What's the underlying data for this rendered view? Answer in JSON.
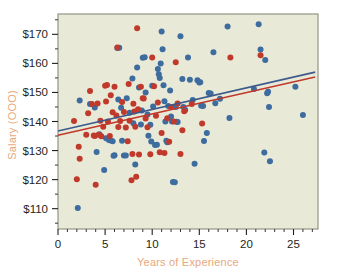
{
  "chart_data": {
    "type": "scatter",
    "title": "",
    "xlabel": "Years of Experience",
    "ylabel": "Salary (OOO)",
    "xlim": [
      0,
      27.6
    ],
    "ylim": [
      103,
      177
    ],
    "grid": false,
    "legend_position": "none",
    "plot_background": "#e9e9d7",
    "plot_border": "#8c8c7a",
    "axis_label_color": "#e8a87c",
    "tick_label_color": "#231f20",
    "x_ticks": [
      0,
      5,
      10,
      15,
      20,
      25
    ],
    "x_tick_labels": [
      "0",
      "5",
      "10",
      "15",
      "20",
      "25"
    ],
    "x_minor_ticks": [
      1,
      2,
      3,
      4,
      6,
      7,
      8,
      9,
      11,
      12,
      13,
      14,
      16,
      17,
      18,
      19,
      21,
      22,
      23,
      24,
      26,
      27
    ],
    "y_ticks": [
      110,
      120,
      130,
      140,
      150,
      160,
      170
    ],
    "y_tick_labels": [
      "$110",
      "$120",
      "$130",
      "$140",
      "$150",
      "$160",
      "$170"
    ],
    "y_minor_ticks": [
      105,
      115,
      125,
      135,
      145,
      155,
      165,
      175
    ],
    "series": [
      {
        "name": "group-blue",
        "color": "#3d6c9e",
        "marker": "circle",
        "marker_size": 4.0,
        "points": [
          [
            2.1,
            110.2
          ],
          [
            2.3,
            147.2
          ],
          [
            3.4,
            146.0
          ],
          [
            3.9,
            144.8
          ],
          [
            4.1,
            129.5
          ],
          [
            4.4,
            135.6
          ],
          [
            4.9,
            123.3
          ],
          [
            5.1,
            134.2
          ],
          [
            5.4,
            133.6
          ],
          [
            5.6,
            133.5
          ],
          [
            5.8,
            133.2
          ],
          [
            5.9,
            128.2
          ],
          [
            6.0,
            128.4
          ],
          [
            6.3,
            165.3
          ],
          [
            6.5,
            165.4
          ],
          [
            6.4,
            147.6
          ],
          [
            6.7,
            144.7
          ],
          [
            6.8,
            133.4
          ],
          [
            7.0,
            128.3
          ],
          [
            7.2,
            128.3
          ],
          [
            7.3,
            148.0
          ],
          [
            7.6,
            143.0
          ],
          [
            7.9,
            154.8
          ],
          [
            8.0,
            139.4
          ],
          [
            8.2,
            125.2
          ],
          [
            8.4,
            158.6
          ],
          [
            8.6,
            151.7
          ],
          [
            8.8,
            139.0
          ],
          [
            8.9,
            143.8
          ],
          [
            9.0,
            161.9
          ],
          [
            9.2,
            162.1
          ],
          [
            9.3,
            150.0
          ],
          [
            9.5,
            142.4
          ],
          [
            9.6,
            135.1
          ],
          [
            9.8,
            138.9
          ],
          [
            9.9,
            133.1
          ],
          [
            10.0,
            152.3
          ],
          [
            10.1,
            145.2
          ],
          [
            10.3,
            131.9
          ],
          [
            10.5,
            132.0
          ],
          [
            10.6,
            158.1
          ],
          [
            10.7,
            156.3
          ],
          [
            10.8,
            155.0
          ],
          [
            10.9,
            160.0
          ],
          [
            11.0,
            171.0
          ],
          [
            11.1,
            164.9
          ],
          [
            11.2,
            152.5
          ],
          [
            11.3,
            147.0
          ],
          [
            11.4,
            140.0
          ],
          [
            11.5,
            133.4
          ],
          [
            11.6,
            132.9
          ],
          [
            11.7,
            145.3
          ],
          [
            11.9,
            150.7
          ],
          [
            12.0,
            141.7
          ],
          [
            12.1,
            140.0
          ],
          [
            12.2,
            119.2
          ],
          [
            12.4,
            119.1
          ],
          [
            12.5,
            145.0
          ],
          [
            12.6,
            139.9
          ],
          [
            12.7,
            139.8
          ],
          [
            13.0,
            169.3
          ],
          [
            13.2,
            154.6
          ],
          [
            13.3,
            145.0
          ],
          [
            13.5,
            144.0
          ],
          [
            13.8,
            162.0
          ],
          [
            14.0,
            154.4
          ],
          [
            14.3,
            147.4
          ],
          [
            14.5,
            125.5
          ],
          [
            14.8,
            154.2
          ],
          [
            15.0,
            153.4
          ],
          [
            15.1,
            153.5
          ],
          [
            15.2,
            145.4
          ],
          [
            15.4,
            145.3
          ],
          [
            15.5,
            133.3
          ],
          [
            15.8,
            136.0
          ],
          [
            16.0,
            149.8
          ],
          [
            16.2,
            149.6
          ],
          [
            16.5,
            163.8
          ],
          [
            16.7,
            146.3
          ],
          [
            17.2,
            147.8
          ],
          [
            18.0,
            172.7
          ],
          [
            18.2,
            141.2
          ],
          [
            20.8,
            151.2
          ],
          [
            21.3,
            173.5
          ],
          [
            21.5,
            164.8
          ],
          [
            21.9,
            129.3
          ],
          [
            22.0,
            161.2
          ],
          [
            22.2,
            149.7
          ],
          [
            22.3,
            150.2
          ],
          [
            22.4,
            145.0
          ],
          [
            22.5,
            126.3
          ],
          [
            25.2,
            152.0
          ],
          [
            26.0,
            142.2
          ]
        ]
      },
      {
        "name": "group-red",
        "color": "#c0392b",
        "marker": "circle",
        "marker_size": 4.0,
        "points": [
          [
            1.7,
            140.2
          ],
          [
            2.0,
            120.1
          ],
          [
            2.2,
            131.3
          ],
          [
            2.3,
            127.2
          ],
          [
            3.0,
            135.4
          ],
          [
            3.2,
            142.8
          ],
          [
            3.4,
            150.5
          ],
          [
            3.6,
            146.0
          ],
          [
            3.8,
            135.2
          ],
          [
            3.9,
            135.0
          ],
          [
            4.0,
            118.2
          ],
          [
            4.2,
            146.2
          ],
          [
            4.3,
            135.4
          ],
          [
            4.5,
            140.3
          ],
          [
            4.6,
            134.9
          ],
          [
            4.8,
            138.2
          ],
          [
            5.0,
            152.3
          ],
          [
            5.1,
            146.9
          ],
          [
            5.2,
            152.6
          ],
          [
            5.3,
            140.0
          ],
          [
            5.5,
            135.0
          ],
          [
            5.6,
            149.0
          ],
          [
            5.8,
            143.2
          ],
          [
            6.0,
            152.0
          ],
          [
            6.2,
            142.1
          ],
          [
            6.3,
            165.5
          ],
          [
            6.4,
            138.1
          ],
          [
            6.6,
            140.2
          ],
          [
            6.8,
            146.7
          ],
          [
            7.0,
            143.3
          ],
          [
            7.2,
            137.9
          ],
          [
            7.4,
            133.2
          ],
          [
            7.5,
            152.9
          ],
          [
            7.6,
            140.3
          ],
          [
            7.8,
            119.8
          ],
          [
            7.9,
            128.8
          ],
          [
            8.0,
            146.1
          ],
          [
            8.1,
            143.4
          ],
          [
            8.2,
            138.2
          ],
          [
            8.3,
            121.0
          ],
          [
            8.4,
            172.1
          ],
          [
            8.5,
            144.2
          ],
          [
            8.6,
            128.6
          ],
          [
            8.8,
            152.0
          ],
          [
            9.0,
            148.0
          ],
          [
            9.1,
            147.9
          ],
          [
            9.3,
            141.0
          ],
          [
            9.5,
            138.0
          ],
          [
            9.8,
            128.7
          ],
          [
            10.0,
            162.0
          ],
          [
            10.2,
            152.1
          ],
          [
            10.4,
            142.0
          ],
          [
            10.6,
            146.5
          ],
          [
            10.8,
            129.4
          ],
          [
            11.0,
            136.0
          ],
          [
            11.3,
            129.2
          ],
          [
            11.6,
            141.1
          ],
          [
            11.8,
            133.0
          ],
          [
            12.0,
            145.0
          ],
          [
            12.3,
            140.0
          ],
          [
            12.5,
            160.4
          ],
          [
            12.7,
            146.2
          ],
          [
            13.0,
            128.8
          ],
          [
            13.2,
            137.0
          ],
          [
            13.4,
            143.5
          ],
          [
            14.2,
            146.0
          ],
          [
            15.3,
            139.3
          ],
          [
            18.3,
            162.0
          ],
          [
            21.5,
            162.8
          ]
        ]
      }
    ],
    "trend_lines": [
      {
        "name": "blue-regression",
        "color": "#3d5a8c",
        "width": 1.6,
        "x_start": 0.0,
        "y_start": 136.7,
        "x_end": 27.3,
        "y_end": 157.0
      },
      {
        "name": "red-regression",
        "color": "#c0392b",
        "width": 1.6,
        "x_start": 0.0,
        "y_start": 135.3,
        "x_end": 27.3,
        "y_end": 155.3
      }
    ]
  }
}
